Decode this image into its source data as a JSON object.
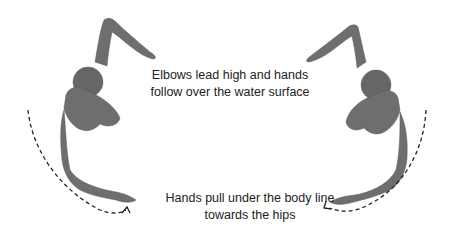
{
  "diagram": {
    "captions": {
      "recovery_line1": "Elbows lead high and hands",
      "recovery_line2": "follow over the water surface",
      "pull_line1": "Hands pull under the body line",
      "pull_line2": "towards the hips"
    },
    "colors": {
      "figure": "#6e6e6e",
      "figure_shade": "#555555",
      "arrow": "#222222",
      "text": "#222222"
    }
  }
}
